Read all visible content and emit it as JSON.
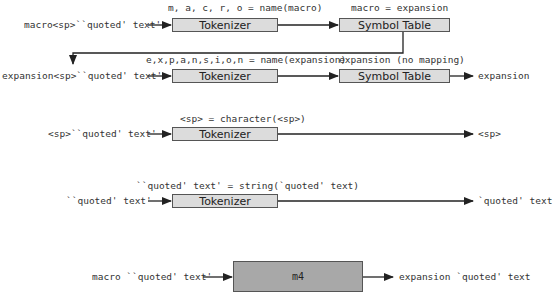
{
  "rows": [
    {
      "input": "macro<sp>``quoted' text'",
      "tokenizer_annotation": "m, a, c, r, o = name(macro)",
      "tokenizer_label": "Tokenizer",
      "symbol_annotation": "macro = expansion",
      "symbol_label": "Symbol Table"
    },
    {
      "input": "expansion<sp>``quoted' text'",
      "tokenizer_annotation": "e,x,p,a,n,s,i,o,n = name(expansion)",
      "tokenizer_label": "Tokenizer",
      "symbol_annotation": "expansion (no mapping)",
      "symbol_label": "Symbol Table",
      "output": "expansion"
    },
    {
      "input": "<sp>``quoted' text'",
      "tokenizer_annotation": "<sp> = character(<sp>)",
      "tokenizer_label": "Tokenizer",
      "output": "<sp>"
    },
    {
      "input": "``quoted' text'",
      "tokenizer_annotation": "``quoted' text' = string(`quoted' text)",
      "tokenizer_label": "Tokenizer",
      "output": "`quoted' text"
    }
  ],
  "summary": {
    "input": "macro ``quoted' text'",
    "processor_label": "m4",
    "output": "expansion `quoted' text"
  },
  "colors": {
    "box_fill": "#dcdcdc",
    "m4_fill": "#a8a8a8",
    "stroke": "#222222"
  }
}
